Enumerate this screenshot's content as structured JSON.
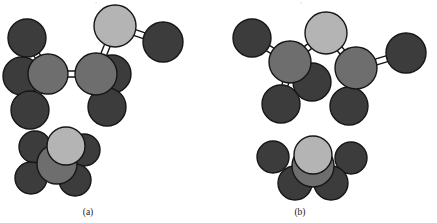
{
  "figure": {
    "kind": "molecular-conformation-diagram",
    "background_color": "#ffffff",
    "panels": [
      {
        "id": "a",
        "caption": "(a)",
        "caption_x": 88,
        "caption_y": 215,
        "conformation": "eclipsed",
        "model_type": "ball-and-stick",
        "inset_type": "end-on-space-filling-projection"
      },
      {
        "id": "b",
        "caption": "(b)",
        "caption_x": 300,
        "caption_y": 215,
        "conformation": "staggered",
        "model_type": "ball-and-stick",
        "inset_type": "end-on-space-filling-projection"
      }
    ]
  },
  "palette": {
    "atom_dark": "#3c3c3c",
    "atom_medium": "#6e6e6e",
    "atom_light": "#b4b4b4",
    "atom_outline": "#161616",
    "bond_fill": "#ffffff",
    "bond_outline": "#161616",
    "caption_color": "#1a1a1a",
    "clipped_text_color": "#cfcfcf"
  },
  "geometry": {
    "atom_radius_large": 19,
    "atom_radius_inset": 16,
    "bond_width": 6,
    "outline_width": 1.4
  },
  "top_clipped_text": {
    "visible": true,
    "note": "partial descenders of a cut-off text line at the very top edge",
    "left_fragment": ",",
    "right_fragment": ","
  },
  "models": {
    "ball_and_stick_a": {
      "atoms": [
        {
          "name": "back-methyl-upper-left",
          "x": 27,
          "y": 38,
          "r": 19,
          "shade": "atom_dark",
          "z": 0
        },
        {
          "name": "back-substituent-left",
          "x": 22,
          "y": 76,
          "r": 19,
          "shade": "atom_dark",
          "z": 0
        },
        {
          "name": "back-substituent-lower-left",
          "x": 30,
          "y": 110,
          "r": 19,
          "shade": "atom_dark",
          "z": 0
        },
        {
          "name": "carbon-left",
          "x": 48,
          "y": 74,
          "r": 20,
          "shade": "atom_medium",
          "z": 3
        },
        {
          "name": "back-substituent-right-hidden",
          "x": 112,
          "y": 74,
          "r": 19,
          "shade": "atom_dark",
          "z": 1
        },
        {
          "name": "carbon-right",
          "x": 96,
          "y": 74,
          "r": 21,
          "shade": "atom_medium",
          "z": 3
        },
        {
          "name": "front-substituent-lower-right",
          "x": 107,
          "y": 107,
          "r": 19,
          "shade": "atom_dark",
          "z": 2
        },
        {
          "name": "top-light-atom",
          "x": 115,
          "y": 26,
          "r": 21,
          "shade": "atom_light",
          "z": 3
        },
        {
          "name": "terminal-dark-atom-right",
          "x": 163,
          "y": 42,
          "r": 20,
          "shade": "atom_dark",
          "z": 2
        }
      ],
      "bonds": [
        {
          "name": "bond-carbonleft-backupperleft",
          "x1": 48,
          "y1": 74,
          "x2": 27,
          "y2": 38
        },
        {
          "name": "bond-carbonleft-backleft",
          "x1": 48,
          "y1": 74,
          "x2": 22,
          "y2": 76
        },
        {
          "name": "bond-carbonleft-lowerleft",
          "x1": 48,
          "y1": 74,
          "x2": 30,
          "y2": 110
        },
        {
          "name": "bond-carbonleft-carbonright",
          "x1": 48,
          "y1": 74,
          "x2": 96,
          "y2": 74
        },
        {
          "name": "bond-carbonright-hiddenright",
          "x1": 96,
          "y1": 74,
          "x2": 112,
          "y2": 74
        },
        {
          "name": "bond-carbonright-lowerright",
          "x1": 96,
          "y1": 74,
          "x2": 107,
          "y2": 107
        },
        {
          "name": "bond-carbonright-toplight",
          "x1": 96,
          "y1": 74,
          "x2": 115,
          "y2": 26
        },
        {
          "name": "bond-toplight-terminaldark",
          "x1": 115,
          "y1": 26,
          "x2": 163,
          "y2": 42
        }
      ]
    },
    "ball_and_stick_b": {
      "atoms": [
        {
          "name": "back-methyl-upper-left",
          "x": 252,
          "y": 38,
          "r": 19,
          "shade": "atom_dark",
          "z": 0
        },
        {
          "name": "carbon-left",
          "x": 290,
          "y": 62,
          "r": 21,
          "shade": "atom_medium",
          "z": 3
        },
        {
          "name": "back-substituent-right-hidden",
          "x": 312,
          "y": 82,
          "r": 19,
          "shade": "atom_dark",
          "z": 1
        },
        {
          "name": "front-substituent-lower-left",
          "x": 281,
          "y": 104,
          "r": 19,
          "shade": "atom_dark",
          "z": 2
        },
        {
          "name": "top-light-atom",
          "x": 326,
          "y": 33,
          "r": 21,
          "shade": "atom_light",
          "z": 3
        },
        {
          "name": "carbon-right",
          "x": 356,
          "y": 68,
          "r": 21,
          "shade": "atom_medium",
          "z": 3
        },
        {
          "name": "front-substituent-lower-right",
          "x": 349,
          "y": 106,
          "r": 19,
          "shade": "atom_dark",
          "z": 2
        },
        {
          "name": "terminal-dark-atom-right",
          "x": 406,
          "y": 53,
          "r": 20,
          "shade": "atom_dark",
          "z": 2
        }
      ],
      "bonds": [
        {
          "name": "bond-carbonleft-backupperleft",
          "x1": 290,
          "y1": 62,
          "x2": 252,
          "y2": 38
        },
        {
          "name": "bond-carbonleft-hiddenright",
          "x1": 290,
          "y1": 62,
          "x2": 312,
          "y2": 82
        },
        {
          "name": "bond-carbonleft-lowerleft",
          "x1": 290,
          "y1": 62,
          "x2": 281,
          "y2": 104
        },
        {
          "name": "bond-carbonleft-toplight",
          "x1": 290,
          "y1": 62,
          "x2": 326,
          "y2": 33
        },
        {
          "name": "bond-toplight-carbonright",
          "x1": 326,
          "y1": 33,
          "x2": 356,
          "y2": 68
        },
        {
          "name": "bond-carbonright-lowerright",
          "x1": 356,
          "y1": 68,
          "x2": 349,
          "y2": 106
        },
        {
          "name": "bond-carbonright-terminaldark",
          "x1": 356,
          "y1": 68,
          "x2": 406,
          "y2": 53
        }
      ]
    },
    "inset_a": {
      "label": "eclipsed-end-on-view",
      "atoms": [
        {
          "name": "inset-rear-upper-left",
          "x": 35,
          "y": 147,
          "r": 16,
          "shade": "atom_dark",
          "z": 0
        },
        {
          "name": "inset-rear-right",
          "x": 84,
          "y": 150,
          "r": 16,
          "shade": "atom_dark",
          "z": 0
        },
        {
          "name": "inset-rear-lower-left",
          "x": 31,
          "y": 178,
          "r": 16,
          "shade": "atom_dark",
          "z": 0
        },
        {
          "name": "inset-rear-lower-right",
          "x": 75,
          "y": 180,
          "r": 16,
          "shade": "atom_dark",
          "z": 0
        },
        {
          "name": "inset-hub",
          "x": 57,
          "y": 164,
          "r": 20,
          "shade": "atom_medium",
          "z": 2
        },
        {
          "name": "inset-front-light",
          "x": 66,
          "y": 146,
          "r": 19,
          "shade": "atom_light",
          "z": 3
        }
      ]
    },
    "inset_b": {
      "label": "staggered-end-on-view",
      "atoms": [
        {
          "name": "inset-rear-left",
          "x": 273,
          "y": 157,
          "r": 16,
          "shade": "atom_dark",
          "z": 0
        },
        {
          "name": "inset-rear-right",
          "x": 351,
          "y": 158,
          "r": 16,
          "shade": "atom_dark",
          "z": 0
        },
        {
          "name": "inset-front-lower-left",
          "x": 295,
          "y": 183,
          "r": 17,
          "shade": "atom_dark",
          "z": 1
        },
        {
          "name": "inset-front-lower-right",
          "x": 331,
          "y": 183,
          "r": 17,
          "shade": "atom_dark",
          "z": 1
        },
        {
          "name": "inset-hub",
          "x": 313,
          "y": 166,
          "r": 21,
          "shade": "atom_medium",
          "z": 2
        },
        {
          "name": "inset-front-light",
          "x": 313,
          "y": 155,
          "r": 19,
          "shade": "atom_light",
          "z": 3
        }
      ]
    }
  }
}
